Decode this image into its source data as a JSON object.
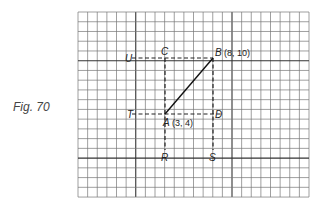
{
  "figure": {
    "caption": "Fig. 70"
  },
  "grid": {
    "left": 78,
    "top": 12,
    "cols": 24,
    "rows": 19,
    "cell_w": 9.625,
    "cell_h": 9.74,
    "heavy_cols": [
      6,
      16
    ],
    "heavy_rows": [
      5,
      15
    ],
    "line_color": "#777777",
    "heavy_color": "#333333"
  },
  "points": {
    "A": {
      "label": "A",
      "coords_text": "(3, 4)",
      "col": 9,
      "row": 10.6
    },
    "B": {
      "label": "B",
      "coords_text": "(8, 10)",
      "col": 14,
      "row": 4.75
    },
    "C": {
      "label": "C"
    },
    "D": {
      "label": "D"
    },
    "T": {
      "label": "T"
    },
    "U": {
      "label": "U"
    },
    "R": {
      "label": "R"
    },
    "S": {
      "label": "S"
    }
  },
  "labels": {
    "A": "A",
    "A_coords": "(3, 4)",
    "B": "B",
    "B_coords": "(8, 10)",
    "C": "C",
    "D": "D",
    "T": "T",
    "U": "U",
    "R": "R",
    "S": "S"
  }
}
